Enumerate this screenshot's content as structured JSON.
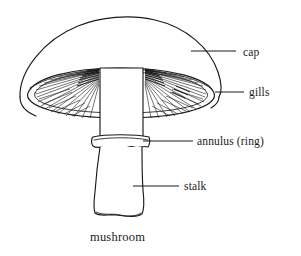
{
  "figure": {
    "title": "mushroom",
    "style": "black and white line drawing",
    "background_color": "#ffffff",
    "ink_color": "#1a1a1a"
  },
  "labels": [
    {
      "id": "cap",
      "text": "cap",
      "text_x": 243,
      "text_y": 56,
      "leader_x1": 191,
      "leader_y1": 51,
      "leader_x2": 236,
      "leader_y2": 51
    },
    {
      "id": "gills",
      "text": "gills",
      "text_x": 249,
      "text_y": 96,
      "leader_x1": 215,
      "leader_y1": 92,
      "leader_x2": 244,
      "leader_y2": 92
    },
    {
      "id": "annulus",
      "text": "annulus (ring)",
      "text_x": 197,
      "text_y": 145,
      "leader_x1": 143,
      "leader_y1": 141,
      "leader_x2": 193,
      "leader_y2": 141
    },
    {
      "id": "stalk",
      "text": "stalk",
      "text_x": 184,
      "text_y": 190,
      "leader_x1": 133,
      "leader_y1": 186,
      "leader_x2": 179,
      "leader_y2": 186
    }
  ],
  "caption": {
    "text": "mushroom",
    "x": 90,
    "y": 241
  },
  "parts": {
    "cap": "dome-shaped cap",
    "gills": "radiating gills under the cap",
    "annulus": "wavy ring around the stalk",
    "stalk": "thick stem widening toward the base"
  }
}
